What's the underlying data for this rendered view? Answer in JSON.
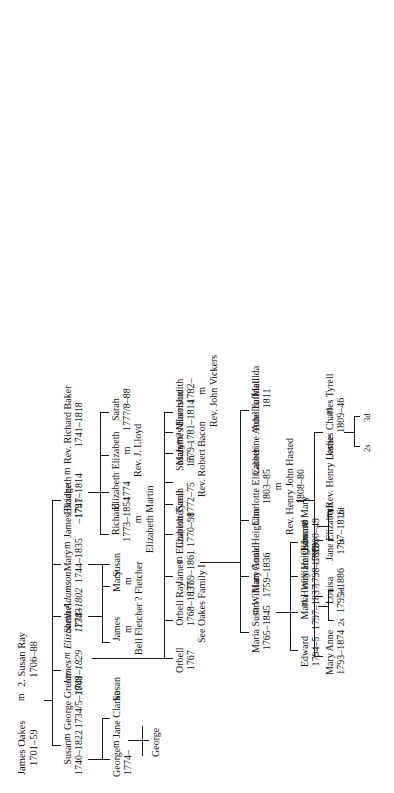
{
  "chart": {
    "type": "genealogy-tree",
    "title": "Oakes Family",
    "orientation": "rotated-90-ccw",
    "ink_color": "#1a1a1a",
    "background": "#ffffff"
  },
  "symbols": {
    "marriage": "m",
    "sons_abbrev": "s",
    "daughters_abbrev": "d"
  },
  "generations": {
    "g1": {
      "label": "generation-1",
      "people": [
        {
          "id": "james_oakes",
          "name": "James Oakes",
          "dates": "1701–59"
        },
        {
          "id": "susan_ray",
          "name": "2. Susan Ray",
          "dates": "1706–88"
        }
      ],
      "union_label": "m"
    },
    "g2": {
      "label": "generation-2",
      "people": [
        {
          "id": "susan_oakes",
          "name": "Susan",
          "dates": "1740–1822"
        },
        {
          "id": "george_green",
          "name": "George Green",
          "dates": "1734/5–1808"
        },
        {
          "id": "james_oakes2",
          "name": "James",
          "dates": "1741–1829",
          "italic": true
        },
        {
          "id": "elizabeth_adamson",
          "name": "Elizabeth Adamson",
          "dates": "1738–1802",
          "italic": true
        },
        {
          "id": "samuel",
          "name": "Samuel",
          "dates": "1743"
        },
        {
          "id": "mary_oakes",
          "name": "Mary",
          "dates": "1744–1835"
        },
        {
          "id": "james_bridge",
          "name": "James Bridge",
          "dates": "–1791"
        },
        {
          "id": "elizabeth_oakes",
          "name": "Elizabeth",
          "dates": "1747–1814"
        },
        {
          "id": "rev_richard_baker",
          "name": "Rev. Richard Baker",
          "dates": "1741–1818"
        }
      ]
    },
    "g3": {
      "label": "generation-3",
      "people": [
        {
          "id": "george_green_jr",
          "name": "George",
          "dates": "1774–"
        },
        {
          "id": "jane_clarke",
          "name": "Jane Clarke",
          "dates": ""
        },
        {
          "id": "susan_green",
          "name": "Susan",
          "dates": ""
        },
        {
          "id": "james_fletcher",
          "name": "James",
          "dates": ""
        },
        {
          "id": "bell_fletcher",
          "name": "Bell Fletcher",
          "dates": ""
        },
        {
          "id": "mary_fletcher",
          "name": "Mary",
          "dates": ""
        },
        {
          "id": "q_fletcher",
          "name": "? Fletcher",
          "dates": ""
        },
        {
          "id": "susan_bridge",
          "name": "Susan",
          "dates": ""
        },
        {
          "id": "richard_baker",
          "name": "Richard",
          "dates": "1773–1854"
        },
        {
          "id": "elizabeth_martin",
          "name": "Elizabeth Martin",
          "dates": ""
        },
        {
          "id": "elizabeth_baker",
          "name": "Elizabeth",
          "dates": "1774"
        },
        {
          "id": "elizabeth_baker2",
          "name": "Elizabeth",
          "dates": ""
        },
        {
          "id": "rev_j_lloyd",
          "name": "Rev. J. Lloyd",
          "dates": ""
        },
        {
          "id": "sarah_baker",
          "name": "Sarah",
          "dates": "1777/8–88"
        },
        {
          "id": "orbell",
          "name": "Orbell",
          "dates": "1767"
        },
        {
          "id": "orbell_ray",
          "name": "Orbell Ray",
          "dates": "1768–1837",
          "note": "See Oakes Family I"
        },
        {
          "id": "james_oakes3",
          "name": "James",
          "dates": "1769–1861"
        },
        {
          "id": "elizabeth_tyrell",
          "name": "Elizabeth Tyrell",
          "dates": ""
        },
        {
          "id": "charlotte",
          "name": "Charlotte",
          "dates": "1770–98"
        },
        {
          "id": "sarah",
          "name": "Sarah",
          "dates": "1772–75"
        },
        {
          "id": "susan_baker",
          "name": "Susan",
          "dates": ""
        },
        {
          "id": "rev_robert_bacon",
          "name": "Rev. Robert Bacon",
          "dates": ""
        },
        {
          "id": "mary_baker",
          "name": "Mary",
          "dates": "1779–"
        },
        {
          "id": "q_mason",
          "name": "? Mason",
          "dates": ""
        },
        {
          "id": "james_harrison",
          "name": "James Harrison",
          "dates": "1781–1814"
        },
        {
          "id": "judith",
          "name": "Judith",
          "dates": "1782–"
        },
        {
          "id": "rev_john_vickers",
          "name": "Rev. John Vickers",
          "dates": ""
        }
      ]
    },
    "g4": {
      "label": "generation-4",
      "people": [
        {
          "id": "george_green_iii",
          "name": "George",
          "dates": ""
        },
        {
          "id": "maria_susan",
          "name": "Maria Susan",
          "dates": "1765–1845"
        },
        {
          "id": "william_gould",
          "name": "William Gould",
          "dates": "1759–1836"
        },
        {
          "id": "mary_anne_heigham",
          "name": "Mary Anne Heigham",
          "dates": ""
        },
        {
          "id": "charlotte_elizabeth",
          "name": "Charlotte Elizabeth",
          "dates": "1803–85"
        },
        {
          "id": "rev_henry_john_hasted",
          "name": "Rev. Henry John Hasted",
          "dates": "1808–80"
        },
        {
          "id": "catherine_anne_tuffnell",
          "name": "Catherine Anne Tuffnell",
          "dates": ""
        },
        {
          "id": "adelina_matilda",
          "name": "Adelina Matilda",
          "dates": "1811"
        }
      ]
    },
    "g5": {
      "label": "generation-5",
      "people": [
        {
          "id": "edward_gould",
          "name": "Edward",
          "dates": "1794–5"
        },
        {
          "id": "maria_gould",
          "name": "Maria",
          "dates": "1797–1837"
        },
        {
          "id": "henry_heigham",
          "name": "Henry Heigham",
          "dates": "1798–1879"
        },
        {
          "id": "william_osborne",
          "name": "William Osborne",
          "dates": "1799"
        },
        {
          "id": "edward_osborne",
          "name": "Edward",
          "dates": "1800–49"
        },
        {
          "id": "mary_osborne",
          "name": "Mary",
          "dates": ""
        },
        {
          "id": "mary_anne_hasted",
          "name": "Mary Anne",
          "dates": "1793–1874"
        },
        {
          "id": "louisa",
          "name": "Louisa",
          "dates": "1795–1886"
        },
        {
          "id": "jane_elizabeth",
          "name": "Jane Elizabeth",
          "dates": "1797–1816"
        },
        {
          "id": "rev_henry_leslie",
          "name": "Rev. Henry Leslie",
          "dates": ""
        },
        {
          "id": "james_charles_tyrell",
          "name": "James Charles Tyrell",
          "dates": "1809–46"
        }
      ]
    }
  },
  "issue_markers": [
    {
      "id": "issue_maria_heigham",
      "sons": "2s",
      "daughters": "3d"
    },
    {
      "id": "issue_edward_mary",
      "sons": "1s",
      "daughters": "2d"
    },
    {
      "id": "issue_tyrell_tuffnell",
      "sons": "2s",
      "daughters": "3d"
    }
  ],
  "notes": [
    {
      "id": "see_oakes_family_i",
      "text": "See Oakes Family I"
    }
  ]
}
